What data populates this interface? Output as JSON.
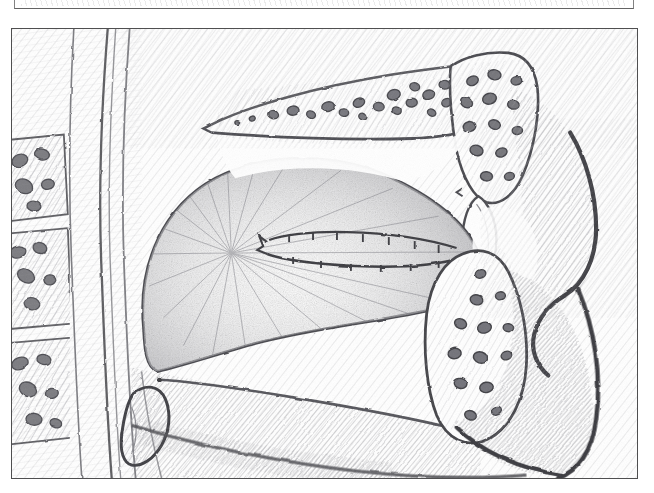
{
  "page": {
    "background_color": "#ffffff",
    "width": 654,
    "height": 493,
    "medium": "graphite pencil drawing on white paper",
    "has_text_labels": false
  },
  "previous_figure_sliver": {
    "name": "partial bottom border of the figure above",
    "visible_height_px": 9,
    "border_color": "#4a4a4a"
  },
  "figure": {
    "frame": {
      "border_color": "#4f4f50",
      "border_width_px": 1.6,
      "x": 11,
      "y": 28,
      "width": 627,
      "height": 451
    },
    "title": "",
    "caption": "",
    "palette": {
      "paper": "#ffffff",
      "light_hatch": "#c9c9cb",
      "mid_hatch": "#9a9a9e",
      "dark_outline": "#5c5c5e",
      "heavy_outline": "#3d3d3f",
      "bone_cell_fill": "#7e7e82",
      "tongue_tone": "#bdbdc0",
      "cavity_void": "#ffffff"
    }
  },
  "structures": [
    {
      "id": "hard-palate",
      "label": "Hard palate",
      "region": "upper middle",
      "texture": "trabecular bone with dark marrow cells"
    },
    {
      "id": "soft-palate",
      "label": "Soft palate",
      "region": "upper right",
      "texture": "diagonal hatching"
    },
    {
      "id": "uvula",
      "label": "Uvula",
      "region": "right centre",
      "texture": "outlined lobe, light hatch"
    },
    {
      "id": "tongue",
      "label": "Tongue (body and root)",
      "region": "centre",
      "texture": "radial pencil shading"
    },
    {
      "id": "sulcus-terminalis",
      "label": "Sulcus terminalis / papillae row",
      "region": "tongue dorsum",
      "texture": "scalloped double line"
    },
    {
      "id": "oral-cavity",
      "label": "Oral cavity proper",
      "region": "between tongue and palate",
      "texture": "blank white void"
    },
    {
      "id": "oropharynx",
      "label": "Oropharynx",
      "region": "right",
      "texture": "blank white void"
    },
    {
      "id": "maxilla-alveolus",
      "label": "Maxillary alveolar bone",
      "region": "upper far right",
      "texture": "trabecular bone cells"
    },
    {
      "id": "mandible",
      "label": "Mandible / mandibular ramus",
      "region": "lower right",
      "texture": "trabecular bone cells"
    },
    {
      "id": "epiglottis",
      "label": "Epiglottis",
      "region": "lower centre-left",
      "texture": "hooked outline, light hatch"
    },
    {
      "id": "floor-of-mouth",
      "label": "Floor of mouth / genioglossus",
      "region": "lower centre",
      "texture": "fine diagonal hatching"
    },
    {
      "id": "pharyngeal-wall",
      "label": "Posterior pharyngeal wall",
      "region": "left",
      "texture": "long vertical strokes"
    },
    {
      "id": "cervical-vertebrae",
      "label": "Cervical vertebral bodies",
      "region": "far left",
      "texture": "stacked blocks with marrow cells"
    },
    {
      "id": "submandibular-mass",
      "label": "Submandibular soft tissue",
      "region": "bottom right",
      "texture": "heavy diagonal hatching"
    }
  ],
  "chart_data": null
}
